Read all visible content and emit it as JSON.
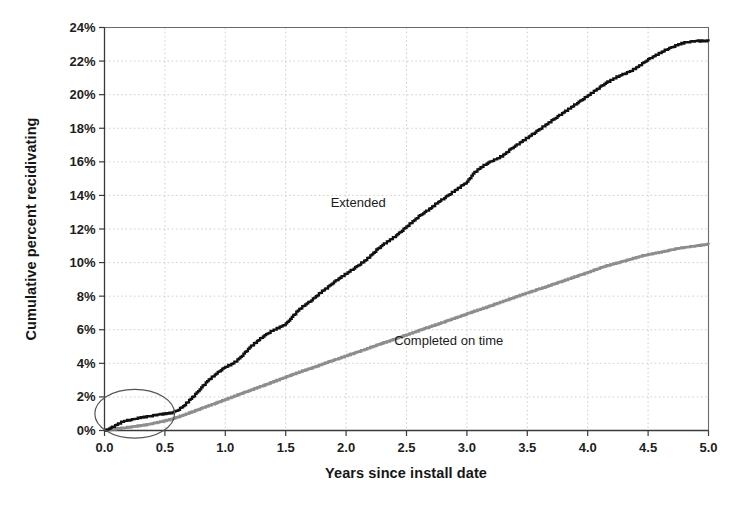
{
  "chart_data": {
    "type": "line",
    "title": "",
    "subtitle": "",
    "xlabel": "Years since install date",
    "ylabel": "Cumulative percent recidivating",
    "xlim": [
      0.0,
      5.0
    ],
    "ylim": [
      0,
      24
    ],
    "grid": true,
    "legend_position": "inline-annotations",
    "x_ticks": [
      "0.0",
      "0.5",
      "1.0",
      "1.5",
      "2.0",
      "2.5",
      "3.0",
      "3.5",
      "4.0",
      "4.5",
      "5.0"
    ],
    "x_tick_values": [
      0.0,
      0.5,
      1.0,
      1.5,
      2.0,
      2.5,
      3.0,
      3.5,
      4.0,
      4.5,
      5.0
    ],
    "y_ticks": [
      "0%",
      "2%",
      "4%",
      "6%",
      "8%",
      "10%",
      "12%",
      "14%",
      "16%",
      "18%",
      "20%",
      "22%",
      "24%"
    ],
    "y_tick_values": [
      0,
      2,
      4,
      6,
      8,
      10,
      12,
      14,
      16,
      18,
      20,
      22,
      24
    ],
    "y_unit": "%",
    "colors": {
      "extended": "#111111",
      "completed": "#8d8d8d",
      "grid": "#c9c9c9",
      "axis": "#3a3a3a",
      "annotation": "#555555",
      "background": "#ffffff"
    },
    "annotations": [
      {
        "name": "highlight-ellipse",
        "shape": "ellipse",
        "cx": 0.25,
        "cy": 1.0,
        "rx": 0.33,
        "ry": 1.45,
        "note": "hand-drawn oval highlighting the earliest follow-up period near the origin"
      }
    ],
    "series": [
      {
        "name": "Extended",
        "label": "Extended",
        "label_x": 2.1,
        "label_y": 13.3,
        "color": "#111111",
        "x": [
          0.0,
          0.05,
          0.1,
          0.15,
          0.2,
          0.25,
          0.3,
          0.35,
          0.4,
          0.45,
          0.5,
          0.55,
          0.6,
          0.65,
          0.7,
          0.75,
          0.8,
          0.85,
          0.9,
          0.95,
          1.0,
          1.05,
          1.1,
          1.15,
          1.2,
          1.25,
          1.3,
          1.35,
          1.4,
          1.45,
          1.5,
          1.55,
          1.6,
          1.65,
          1.7,
          1.75,
          1.8,
          1.85,
          1.9,
          1.95,
          2.0,
          2.05,
          2.1,
          2.15,
          2.2,
          2.25,
          2.3,
          2.35,
          2.4,
          2.45,
          2.5,
          2.55,
          2.6,
          2.65,
          2.7,
          2.75,
          2.8,
          2.85,
          2.9,
          2.95,
          3.0,
          3.05,
          3.1,
          3.15,
          3.2,
          3.25,
          3.3,
          3.35,
          3.4,
          3.45,
          3.5,
          3.55,
          3.6,
          3.65,
          3.7,
          3.75,
          3.8,
          3.85,
          3.9,
          3.95,
          4.0,
          4.05,
          4.1,
          4.15,
          4.2,
          4.25,
          4.3,
          4.35,
          4.4,
          4.45,
          4.5,
          4.55,
          4.6,
          4.65,
          4.7,
          4.75,
          4.8,
          4.85,
          4.9,
          4.95,
          5.0
        ],
        "y": [
          0.0,
          0.15,
          0.35,
          0.55,
          0.62,
          0.7,
          0.78,
          0.82,
          0.88,
          0.95,
          1.0,
          1.05,
          1.2,
          1.45,
          1.8,
          2.15,
          2.55,
          2.95,
          3.25,
          3.55,
          3.8,
          3.95,
          4.2,
          4.55,
          4.95,
          5.25,
          5.55,
          5.8,
          6.0,
          6.15,
          6.35,
          6.75,
          7.15,
          7.45,
          7.7,
          8.0,
          8.3,
          8.55,
          8.85,
          9.1,
          9.35,
          9.6,
          9.85,
          10.1,
          10.4,
          10.75,
          11.05,
          11.3,
          11.55,
          11.85,
          12.15,
          12.45,
          12.75,
          13.0,
          13.25,
          13.55,
          13.8,
          14.05,
          14.3,
          14.55,
          14.8,
          15.3,
          15.6,
          15.85,
          16.05,
          16.2,
          16.4,
          16.7,
          16.95,
          17.2,
          17.45,
          17.7,
          17.95,
          18.2,
          18.45,
          18.7,
          18.95,
          19.2,
          19.45,
          19.7,
          19.95,
          20.2,
          20.45,
          20.7,
          20.9,
          21.1,
          21.25,
          21.4,
          21.6,
          21.85,
          22.1,
          22.3,
          22.5,
          22.7,
          22.85,
          23.0,
          23.1,
          23.15,
          23.2,
          23.2,
          23.2
        ]
      },
      {
        "name": "Completed on time",
        "label": "Completed on time",
        "label_x": 2.85,
        "label_y": 5.1,
        "color": "#8d8d8d",
        "x": [
          0.0,
          0.05,
          0.1,
          0.15,
          0.2,
          0.25,
          0.3,
          0.35,
          0.4,
          0.45,
          0.5,
          0.55,
          0.6,
          0.65,
          0.7,
          0.75,
          0.8,
          0.85,
          0.9,
          0.95,
          1.0,
          1.05,
          1.1,
          1.15,
          1.2,
          1.25,
          1.3,
          1.35,
          1.4,
          1.45,
          1.5,
          1.55,
          1.6,
          1.65,
          1.7,
          1.75,
          1.8,
          1.85,
          1.9,
          1.95,
          2.0,
          2.05,
          2.1,
          2.15,
          2.2,
          2.25,
          2.3,
          2.35,
          2.4,
          2.45,
          2.5,
          2.55,
          2.6,
          2.65,
          2.7,
          2.75,
          2.8,
          2.85,
          2.9,
          2.95,
          3.0,
          3.05,
          3.1,
          3.15,
          3.2,
          3.25,
          3.3,
          3.35,
          3.4,
          3.45,
          3.5,
          3.55,
          3.6,
          3.65,
          3.7,
          3.75,
          3.8,
          3.85,
          3.9,
          3.95,
          4.0,
          4.05,
          4.1,
          4.15,
          4.2,
          4.25,
          4.3,
          4.35,
          4.4,
          4.45,
          4.5,
          4.55,
          4.6,
          4.65,
          4.7,
          4.75,
          4.8,
          4.85,
          4.9,
          4.95,
          5.0
        ],
        "y": [
          0.0,
          0.05,
          0.1,
          0.15,
          0.2,
          0.25,
          0.3,
          0.35,
          0.42,
          0.5,
          0.58,
          0.68,
          0.8,
          0.92,
          1.05,
          1.18,
          1.32,
          1.45,
          1.58,
          1.72,
          1.85,
          1.98,
          2.12,
          2.25,
          2.38,
          2.52,
          2.65,
          2.78,
          2.92,
          3.05,
          3.18,
          3.32,
          3.45,
          3.58,
          3.7,
          3.82,
          3.95,
          4.08,
          4.2,
          4.32,
          4.45,
          4.58,
          4.7,
          4.82,
          4.95,
          5.08,
          5.2,
          5.32,
          5.45,
          5.58,
          5.7,
          5.82,
          5.95,
          6.08,
          6.2,
          6.32,
          6.45,
          6.58,
          6.7,
          6.82,
          6.95,
          7.08,
          7.2,
          7.32,
          7.45,
          7.58,
          7.7,
          7.82,
          7.95,
          8.08,
          8.2,
          8.32,
          8.45,
          8.55,
          8.68,
          8.8,
          8.92,
          9.05,
          9.18,
          9.3,
          9.42,
          9.55,
          9.68,
          9.8,
          9.9,
          10.0,
          10.1,
          10.2,
          10.3,
          10.4,
          10.48,
          10.55,
          10.62,
          10.7,
          10.78,
          10.85,
          10.9,
          10.95,
          11.0,
          11.05,
          11.1
        ]
      }
    ]
  }
}
